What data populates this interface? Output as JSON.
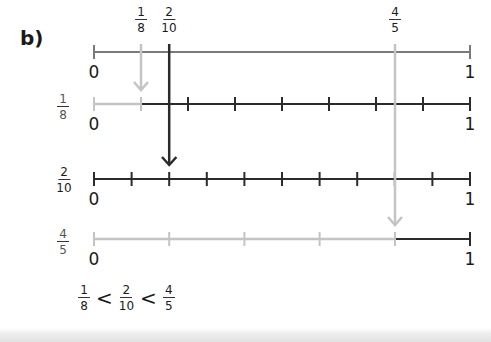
{
  "part_label": "b)",
  "colors": {
    "dark_line": "#2b2b2b",
    "mid_line": "#777777",
    "light_line": "#c4c4c4"
  },
  "top_labels": {
    "eighth": {
      "num": "1",
      "den": "8"
    },
    "two_tenths": {
      "num": "2",
      "den": "10"
    },
    "four_fifths": {
      "num": "4",
      "den": "5"
    }
  },
  "number_lines": [
    {
      "id": "whole",
      "label": null,
      "zero": "0",
      "one": "1",
      "parts": 1,
      "highlight_to": null
    },
    {
      "id": "eighths",
      "label": {
        "num": "1",
        "den": "8"
      },
      "zero": "0",
      "one": "1",
      "parts": 8,
      "highlight": "first 1 of 8 parts shaded light grey"
    },
    {
      "id": "tenths",
      "label": {
        "num": "2",
        "den": "10"
      },
      "zero": "0",
      "one": "1",
      "parts": 10,
      "highlight": "first 2 of 10 parts marked"
    },
    {
      "id": "fifths",
      "label": {
        "num": "4",
        "den": "5"
      },
      "zero": "0",
      "one": "1",
      "parts": 5,
      "highlight": "first 4 of 5 parts shaded light grey"
    }
  ],
  "comparison": {
    "left": {
      "num": "1",
      "den": "8"
    },
    "op1": "<",
    "middle": {
      "num": "2",
      "den": "10"
    },
    "op2": "<",
    "right": {
      "num": "4",
      "den": "5"
    }
  }
}
